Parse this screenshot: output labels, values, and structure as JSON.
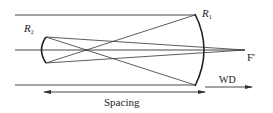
{
  "diagram": {
    "labels": {
      "mirror_primary": "R",
      "mirror_primary_sub": "1",
      "mirror_secondary": "R",
      "mirror_secondary_sub": "2",
      "focal_point": "F'",
      "working_distance": "WD",
      "spacing": "Spacing"
    },
    "colors": {
      "line": "#333333",
      "background": "#ffffff"
    }
  }
}
